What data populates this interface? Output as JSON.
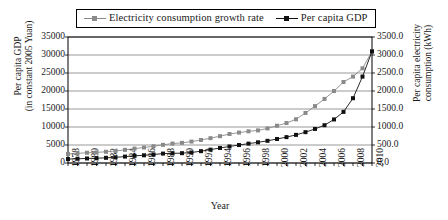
{
  "legend": {
    "border_color": "#000000",
    "entries": [
      {
        "label": "Electricity consumption growth rate",
        "color": "#8a8a8a",
        "marker": "square"
      },
      {
        "label": "Per capita GDP",
        "color": "#111111",
        "marker": "square"
      }
    ]
  },
  "axes": {
    "x_title": "Year",
    "y_left_title_line1": "Per capita GDP",
    "y_left_title_line2": "(in constant 2005 Yuan)",
    "y_right_title_line1": "Per capita electricity",
    "y_right_title_line2": "consumption (kWh)",
    "y_left_ticks": [
      "0",
      "5000",
      "10000",
      "15000",
      "20000",
      "25000",
      "30000",
      "35000"
    ],
    "y_right_ticks": [
      "0.0",
      "500.0",
      "1000.0",
      "1500.0",
      "2000.0",
      "2500.0",
      "3000.0",
      "3500.0"
    ],
    "x_ticks": [
      "1978",
      "1980",
      "1982",
      "1984",
      "1986",
      "1988",
      "1990",
      "1992",
      "1994",
      "1996",
      "1998",
      "2000",
      "2002",
      "2004",
      "2006",
      "2008",
      "2010"
    ]
  },
  "chart_data": {
    "type": "line",
    "title": "",
    "xlabel": "Year",
    "ylabel": "Per capita GDP (in constant 2005 Yuan)",
    "y2label": "Per capita electricity consumption (kWh)",
    "ylim": [
      0,
      35000
    ],
    "y2lim": [
      0,
      3500
    ],
    "xlim": [
      1978,
      2010
    ],
    "grid": true,
    "legend_position": "top",
    "x": [
      1978,
      1979,
      1980,
      1981,
      1982,
      1983,
      1984,
      1985,
      1986,
      1987,
      1988,
      1989,
      1990,
      1991,
      1992,
      1993,
      1994,
      1995,
      1996,
      1997,
      1998,
      1999,
      2000,
      2001,
      2002,
      2003,
      2004,
      2005,
      2006,
      2007,
      2008,
      2009,
      2010
    ],
    "series": [
      {
        "name": "Electricity consumption growth rate",
        "axis": "right",
        "units": "kWh",
        "color": "#8a8a8a",
        "values": [
          250,
          268,
          285,
          295,
          312,
          335,
          365,
          400,
          430,
          465,
          505,
          540,
          560,
          595,
          640,
          690,
          745,
          805,
          845,
          880,
          905,
          960,
          1035,
          1110,
          1215,
          1390,
          1580,
          1780,
          2000,
          2250,
          2400,
          2630,
          3100
        ]
      },
      {
        "name": "Per capita GDP",
        "axis": "left",
        "units": "Yuan (constant 2005)",
        "color": "#111111",
        "values": [
          1100,
          1180,
          1260,
          1330,
          1440,
          1580,
          1780,
          1990,
          2140,
          2370,
          2610,
          2690,
          2730,
          2920,
          3290,
          3710,
          4170,
          4590,
          4990,
          5380,
          5750,
          6160,
          6670,
          7190,
          7810,
          8570,
          9460,
          10500,
          12100,
          14200,
          18000,
          24000,
          31000
        ]
      }
    ]
  }
}
